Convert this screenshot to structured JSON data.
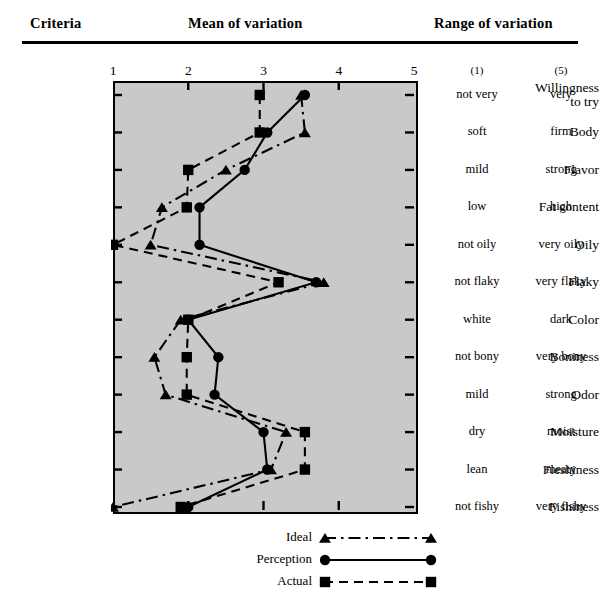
{
  "header": {
    "criteria": "Criteria",
    "mean": "Mean of variation",
    "range": "Range of variation"
  },
  "axis": {
    "ticks": [
      "1",
      "2",
      "3",
      "4",
      "5"
    ]
  },
  "range_header": {
    "low": "(1)",
    "high": "(5)"
  },
  "criteria": [
    {
      "label_line1": "Willingness",
      "label_line2": "to try",
      "low": "not very",
      "high": "very"
    },
    {
      "label_line1": "Body",
      "label_line2": "",
      "low": "soft",
      "high": "firm"
    },
    {
      "label_line1": "Flavor",
      "label_line2": "",
      "low": "mild",
      "high": "strong"
    },
    {
      "label_line1": "Fat content",
      "label_line2": "",
      "low": "low",
      "high": "high"
    },
    {
      "label_line1": "Oily",
      "label_line2": "",
      "low": "not oily",
      "high": "very oily"
    },
    {
      "label_line1": "Flaky",
      "label_line2": "",
      "low": "not flaky",
      "high": "very flaky"
    },
    {
      "label_line1": "Color",
      "label_line2": "",
      "low": "white",
      "high": "dark"
    },
    {
      "label_line1": "Boniness",
      "label_line2": "",
      "low": "not bony",
      "high": "very bony"
    },
    {
      "label_line1": "Odor",
      "label_line2": "",
      "low": "mild",
      "high": "strong"
    },
    {
      "label_line1": "Moisture",
      "label_line2": "",
      "low": "dry",
      "high": "moist"
    },
    {
      "label_line1": "Fleshiness",
      "label_line2": "",
      "low": "lean",
      "high": "meaty"
    },
    {
      "label_line1": "Fishiness",
      "label_line2": "",
      "low": "not fishy",
      "high": "very fishy"
    }
  ],
  "legend": [
    {
      "label": "Ideal",
      "marker": "triangle",
      "line": "dashdot"
    },
    {
      "label": "Perception",
      "marker": "circle",
      "line": "solid"
    },
    {
      "label": "Actual",
      "marker": "square",
      "line": "dashed"
    }
  ],
  "chart_data": {
    "type": "line",
    "title": "Mean of variation",
    "xlabel": "Mean of variation",
    "ylabel": "Criteria",
    "orientation": "horizontal",
    "xlim": [
      1,
      5
    ],
    "xticks": [
      1,
      2,
      3,
      4,
      5
    ],
    "grid": false,
    "legend_position": "bottom",
    "plot_background": "#c9c9c9",
    "categories": [
      "Willingness to try",
      "Body",
      "Flavor",
      "Fat content",
      "Oily",
      "Flaky",
      "Color",
      "Boniness",
      "Odor",
      "Moisture",
      "Fleshiness",
      "Fishiness"
    ],
    "series": [
      {
        "name": "Ideal",
        "marker": "triangle",
        "line": "dashdot",
        "values": [
          3.5,
          3.55,
          2.5,
          1.65,
          1.5,
          3.8,
          1.9,
          1.55,
          1.7,
          3.3,
          3.1,
          1.0
        ]
      },
      {
        "name": "Perception",
        "marker": "circle",
        "line": "solid",
        "values": [
          3.55,
          3.05,
          2.75,
          2.15,
          2.15,
          3.7,
          2.0,
          2.4,
          2.35,
          3.0,
          3.05,
          2.0
        ]
      },
      {
        "name": "Actual",
        "marker": "square",
        "line": "dashed",
        "values": [
          2.95,
          2.95,
          2.0,
          1.98,
          1.0,
          3.2,
          2.0,
          1.98,
          1.98,
          3.55,
          3.55,
          1.9
        ]
      }
    ],
    "range_scale": [
      {
        "criterion": "Willingness to try",
        "low": "not very",
        "high": "very"
      },
      {
        "criterion": "Body",
        "low": "soft",
        "high": "firm"
      },
      {
        "criterion": "Flavor",
        "low": "mild",
        "high": "strong"
      },
      {
        "criterion": "Fat content",
        "low": "low",
        "high": "high"
      },
      {
        "criterion": "Oily",
        "low": "not oily",
        "high": "very oily"
      },
      {
        "criterion": "Flaky",
        "low": "not flaky",
        "high": "very flaky"
      },
      {
        "criterion": "Color",
        "low": "white",
        "high": "dark"
      },
      {
        "criterion": "Boniness",
        "low": "not bony",
        "high": "very bony"
      },
      {
        "criterion": "Odor",
        "low": "mild",
        "high": "strong"
      },
      {
        "criterion": "Moisture",
        "low": "dry",
        "high": "moist"
      },
      {
        "criterion": "Fleshiness",
        "low": "lean",
        "high": "meaty"
      },
      {
        "criterion": "Fishiness",
        "low": "not fishy",
        "high": "very fishy"
      }
    ]
  }
}
